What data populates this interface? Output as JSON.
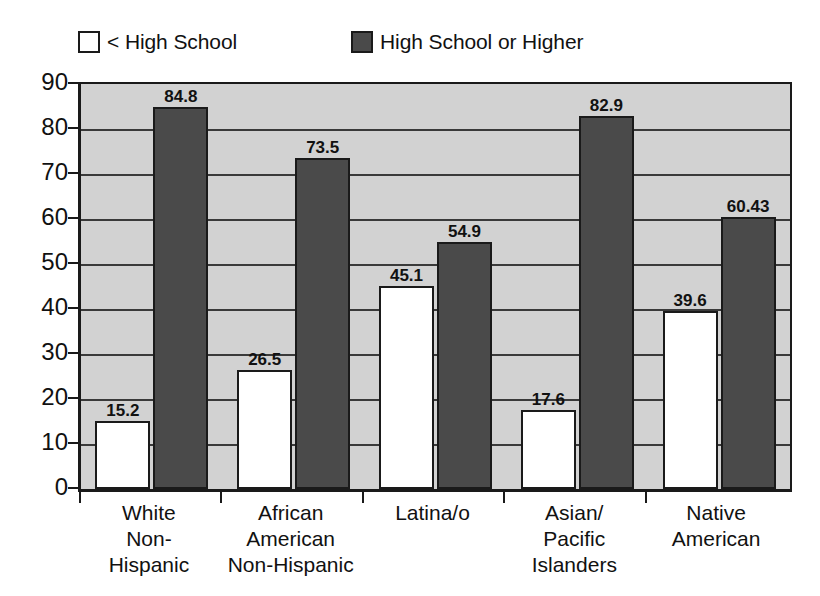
{
  "legend": {
    "entries": [
      {
        "label": "< High School",
        "swatch": "light-square-swatch",
        "color": "#ffffff"
      },
      {
        "label": "High School or Higher",
        "swatch": "dark-square-swatch",
        "color": "#4a4a4a"
      }
    ]
  },
  "chart_data": {
    "type": "bar",
    "title": "",
    "subtitle": "",
    "xlabel": "",
    "ylabel": "",
    "ylim": [
      0,
      90
    ],
    "ytick_step": 10,
    "yticks": [
      0,
      10,
      20,
      30,
      40,
      50,
      60,
      70,
      80,
      90
    ],
    "grid": true,
    "legend_position": "top-left",
    "categories": [
      "White\nNon-\nHispanic",
      "African\nAmerican\nNon-Hispanic",
      "Latina/o",
      "Asian/\nPacific\nIslanders",
      "Native\nAmerican"
    ],
    "series": [
      {
        "name": "< High School",
        "color": "#ffffff",
        "values": [
          15.2,
          26.5,
          45.1,
          17.6,
          39.6
        ],
        "labels": [
          "15.2",
          "26.5",
          "45.1",
          "17.6",
          "39.6"
        ]
      },
      {
        "name": "High School or Higher",
        "color": "#4a4a4a",
        "values": [
          84.8,
          73.5,
          54.9,
          82.9,
          60.43
        ],
        "labels": [
          "84.8",
          "73.5",
          "54.9",
          "82.9",
          "60.43"
        ]
      }
    ],
    "plot_background": "#d2d2d2",
    "axis_color": "#1a1a1a"
  }
}
